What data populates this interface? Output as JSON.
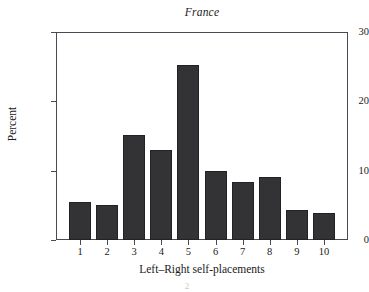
{
  "chart_data": {
    "type": "bar",
    "title": "France",
    "xlabel": "Left–Right self-placements",
    "ylabel": "Percent",
    "categories": [
      "1",
      "2",
      "3",
      "4",
      "5",
      "6",
      "7",
      "8",
      "9",
      "10"
    ],
    "values": [
      5.5,
      5.1,
      15.2,
      13.0,
      25.3,
      10.0,
      8.4,
      9.1,
      4.4,
      3.9
    ],
    "ylim": [
      0,
      30
    ],
    "yticks": [
      0,
      10,
      20,
      30
    ],
    "ytick_labels": [
      "0",
      "10",
      "20",
      "30"
    ],
    "grid": false,
    "legend": "none",
    "bar_color": "#333336",
    "axis_color": "#4a4a55",
    "background": "#ffffff"
  },
  "figure": {
    "page_artifact": "2"
  }
}
